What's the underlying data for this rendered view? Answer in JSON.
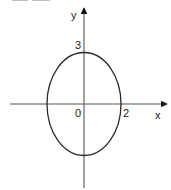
{
  "diagram": {
    "type": "ellipse-on-axes",
    "colors": {
      "stroke": "#2a2a2a",
      "axis": "#555555",
      "text": "#1a1a1a",
      "background": "#ffffff"
    },
    "axes": {
      "x_label": "x",
      "y_label": "y",
      "origin_label": "0"
    },
    "ellipse": {
      "center": [
        0,
        0
      ],
      "semi_axis_x": 2,
      "semi_axis_y": 3,
      "x_intercept_label": "2",
      "y_intercept_label": "3"
    }
  }
}
